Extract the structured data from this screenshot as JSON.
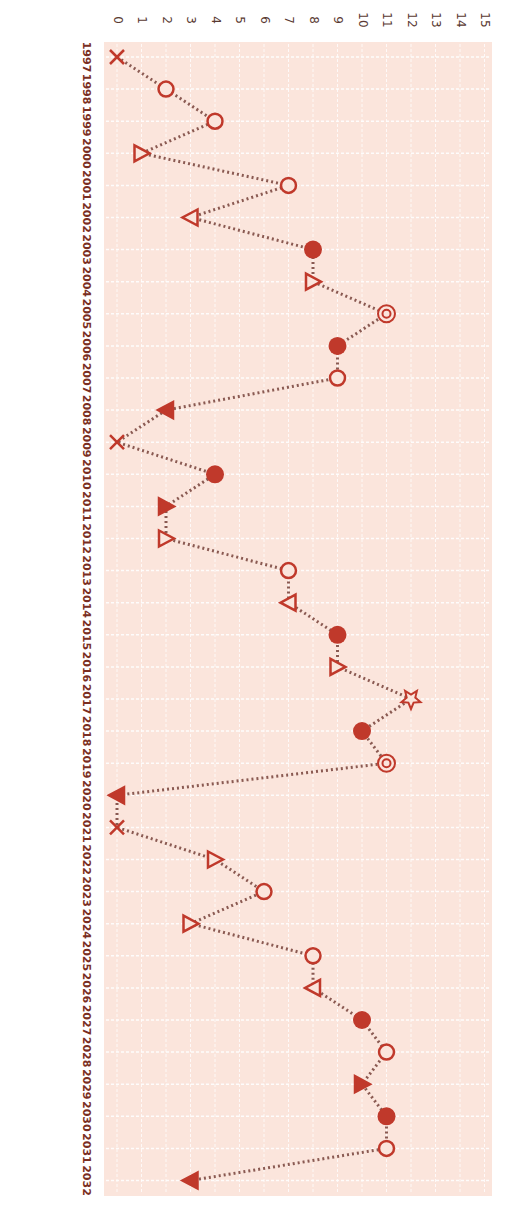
{
  "chart_data": {
    "type": "line",
    "orientation": "rotated-90",
    "title": "",
    "xlabel": "",
    "ylabel": "",
    "ylim": [
      0,
      15
    ],
    "yticks": [
      0,
      1,
      2,
      3,
      4,
      5,
      6,
      7,
      8,
      9,
      10,
      11,
      12,
      13,
      14,
      15
    ],
    "grid": true,
    "legend": false,
    "categories": [
      "1997",
      "1998",
      "1999",
      "2000",
      "2001",
      "2002",
      "2003",
      "2004",
      "2005",
      "2006",
      "2007",
      "2008",
      "2009",
      "2010",
      "2011",
      "2012",
      "2013",
      "2014",
      "2015",
      "2016",
      "2017",
      "2018",
      "2019",
      "2020",
      "2021",
      "2022",
      "2023",
      "2024",
      "2025",
      "2026",
      "2027",
      "2028",
      "2029",
      "2030",
      "2031",
      "2032"
    ],
    "series": [
      {
        "name": "series",
        "values": [
          0,
          2,
          4,
          1,
          7,
          3,
          8,
          8,
          11,
          9,
          9,
          2,
          0,
          4,
          2,
          2,
          7,
          7,
          9,
          9,
          12,
          10,
          11,
          0,
          0,
          4,
          6,
          3,
          8,
          8,
          10,
          11,
          10,
          11,
          11,
          3
        ],
        "markers": [
          "x",
          "circle",
          "circle",
          "tri-right",
          "circle",
          "tri-left",
          "dot",
          "tri-right",
          "bullseye",
          "dot",
          "circle",
          "tri-left-filled",
          "x",
          "dot",
          "tri-right-filled",
          "tri-right",
          "circle",
          "tri-left",
          "dot",
          "tri-right",
          "star",
          "dot",
          "bullseye",
          "tri-left-filled",
          "x",
          "tri-right",
          "circle",
          "tri-right",
          "circle",
          "tri-left",
          "dot",
          "circle",
          "tri-right-filled",
          "dot",
          "circle",
          "tri-left-filled"
        ]
      }
    ]
  },
  "colors": {
    "plot_background": "#fbe5dc",
    "grid": "#ffffff",
    "marker": "#c0392b",
    "line": "#8a5a52",
    "text": "#5a3a32"
  }
}
